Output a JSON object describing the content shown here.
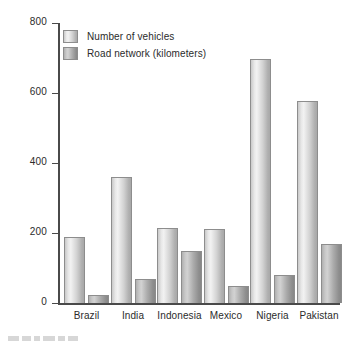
{
  "chart_data": {
    "type": "bar",
    "title": "",
    "xlabel": "",
    "ylabel": "% Total growth",
    "ylim": [
      0,
      800
    ],
    "yticks": [
      0,
      200,
      400,
      600,
      800
    ],
    "ytick_labels": [
      "0",
      "200",
      "400",
      "600",
      "800"
    ],
    "grid": false,
    "legend_position": "upper-left-inside",
    "categories": [
      "Brazil",
      "India",
      "Indonesia",
      "Mexico",
      "Nigeria",
      "Pakistan"
    ],
    "series": [
      {
        "name": "Number of vehicles",
        "color": "#e2e2e2",
        "values": [
          190,
          360,
          215,
          212,
          697,
          578
        ]
      },
      {
        "name": "Road network (kilometers)",
        "color": "#b6b6b6",
        "values": [
          23,
          68,
          148,
          50,
          80,
          170
        ]
      }
    ]
  },
  "axis": {
    "y_title": "% Total growth",
    "ticks": [
      {
        "label": "800",
        "value": 800
      },
      {
        "label": "600",
        "value": 600
      },
      {
        "label": "400",
        "value": 400
      },
      {
        "label": "200",
        "value": 200
      },
      {
        "label": "0",
        "value": 0
      }
    ]
  },
  "legend": {
    "items": [
      {
        "label": "Number of vehicles"
      },
      {
        "label": "Road network (kilometers)"
      }
    ]
  },
  "xlabels": [
    "Brazil",
    "India",
    "Indonesia",
    "Mexico",
    "Nigeria",
    "Pakistan"
  ]
}
